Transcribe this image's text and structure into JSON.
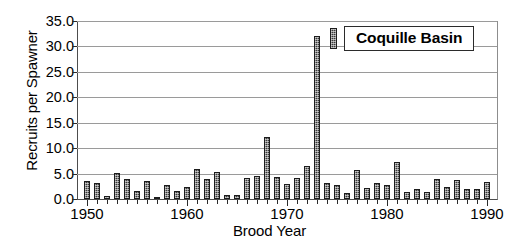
{
  "chart_data": {
    "type": "bar",
    "title": "",
    "legend_label": "Coquille Basin",
    "legend_position": "top-right-inside",
    "xlabel": "Brood Year",
    "ylabel": "Recruits per Spawner",
    "ylim": [
      0.0,
      35.0
    ],
    "ytick_labels": [
      "0.0",
      "5.0",
      "10.0",
      "15.0",
      "20.0",
      "25.0",
      "30.0",
      "35.0"
    ],
    "ytick_values": [
      0.0,
      5.0,
      10.0,
      15.0,
      20.0,
      25.0,
      30.0,
      35.0
    ],
    "xlim": [
      1949,
      1991
    ],
    "xtick_labels": [
      "1950",
      "1960",
      "1970",
      "1980",
      "1990"
    ],
    "xtick_values": [
      1950,
      1960,
      1970,
      1980,
      1990
    ],
    "grid": "horizontal",
    "series_name": "Coquille Basin",
    "bar_color": "#3b3b3b",
    "x": [
      1950,
      1951,
      1952,
      1953,
      1954,
      1955,
      1956,
      1957,
      1958,
      1959,
      1960,
      1961,
      1962,
      1963,
      1964,
      1965,
      1966,
      1967,
      1968,
      1969,
      1970,
      1971,
      1972,
      1973,
      1974,
      1975,
      1976,
      1977,
      1978,
      1979,
      1980,
      1981,
      1982,
      1983,
      1984,
      1985,
      1986,
      1987,
      1988,
      1989,
      1990
    ],
    "values": [
      3.6,
      3.2,
      0.6,
      5.1,
      4.0,
      1.6,
      3.5,
      0.4,
      2.8,
      1.5,
      2.3,
      6.0,
      4.0,
      5.4,
      0.8,
      0.7,
      4.2,
      4.5,
      12.2,
      4.4,
      2.9,
      4.2,
      6.4,
      32.0,
      3.1,
      2.7,
      1.1,
      5.8,
      2.2,
      3.2,
      2.8,
      7.3,
      1.4,
      1.9,
      1.3,
      3.9,
      2.3,
      3.7,
      2.0,
      1.9,
      3.4
    ]
  },
  "axes": {
    "y_title": "Recruits per Spawner",
    "x_title": "Brood Year"
  },
  "legend": {
    "label": "Coquille Basin"
  }
}
